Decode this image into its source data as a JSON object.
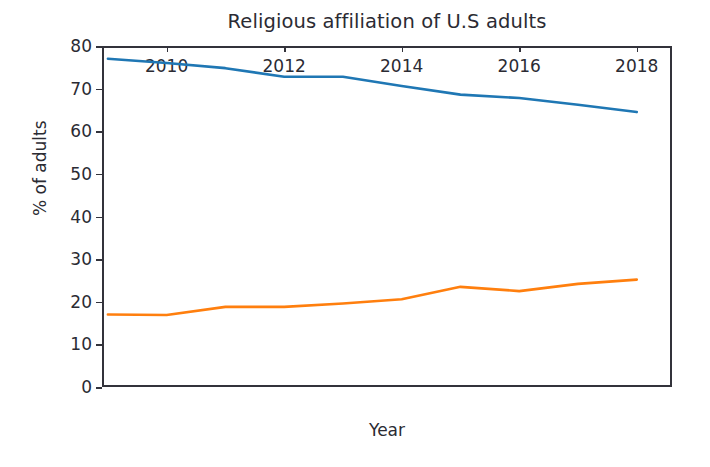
{
  "chart_data": {
    "type": "line",
    "title": "Religious affiliation of U.S adults",
    "xlabel": "Year",
    "ylabel": "% of adults",
    "x": [
      2009,
      2010,
      2011,
      2012,
      2013,
      2014,
      2015,
      2016,
      2017,
      2018
    ],
    "xlim": [
      2008.9,
      2018.6
    ],
    "ylim": [
      0,
      80
    ],
    "xticks": [
      2010,
      2012,
      2014,
      2016,
      2018
    ],
    "xtick_labels": [
      "2010",
      "2012",
      "2014",
      "2016",
      "2018"
    ],
    "yticks": [
      0,
      10,
      20,
      30,
      40,
      50,
      60,
      70,
      80
    ],
    "ytick_labels": [
      "0",
      "10",
      "20",
      "30",
      "40",
      "50",
      "60",
      "70",
      "80"
    ],
    "grid": false,
    "legend": "none",
    "series": [
      {
        "name": "Christian",
        "color": "#1f77b4",
        "values": [
          77.0,
          76.0,
          74.8,
          72.8,
          72.8,
          70.6,
          68.6,
          67.8,
          66.2,
          64.5
        ]
      },
      {
        "name": "Unaffiliated",
        "color": "#ff7f0e",
        "values": [
          17.0,
          16.9,
          18.8,
          18.8,
          19.6,
          20.6,
          23.5,
          22.5,
          24.2,
          25.2
        ]
      }
    ]
  },
  "figure": {
    "background": "#ffffff",
    "axis_color": "#33333b",
    "text_color": "#2b2b33"
  }
}
